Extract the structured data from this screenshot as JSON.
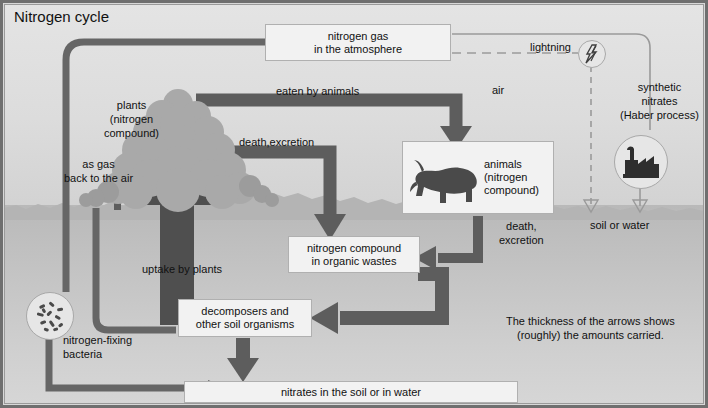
{
  "title": "Nitrogen cycle",
  "boxes": {
    "atmosphere": "nitrogen gas\nin the atmosphere",
    "animals": "animals\n(nitrogen\ncompound)",
    "organic_wastes": "nitrogen compound\nin organic wastes",
    "decomposers": "decomposers and\nother soil organisms",
    "nitrates": "nitrates in the soil or in water"
  },
  "labels": {
    "plants": "plants\n(nitrogen\ncompound)",
    "as_gas": "as gas\nback to the air",
    "eaten_by_animals": "eaten by animals",
    "death_excretion_plants": "death,excretion",
    "air": "air",
    "lightning": "lightning",
    "synthetic_nitrates": "synthetic\nnitrates\n(Haber process)",
    "soil_or_water": "soil or water",
    "death_excretion_animals": "death,\nexcretion",
    "uptake_by_plants": "uptake by plants",
    "nitrogen_fixing_bacteria": "nitrogen-fixing\nbacteria",
    "note": "The thickness of the arrows shows\n(roughly) the amounts carried."
  },
  "icons": {
    "lightning": "lightning-bolt-icon",
    "factory": "factory-icon",
    "bacteria": "bacteria-icon",
    "horse": "grazing-horse-icon",
    "plants": "shrub-tree-icon"
  },
  "colors": {
    "arrow_dark": "#5a5a5a",
    "arrow_mid": "#6e6e6e",
    "sky": "#dcdcdc",
    "ground": "#c2c2c2",
    "box_fill": "#f2f2f2",
    "frame": "#6f6f6f",
    "text": "#111111"
  },
  "legend": {
    "type": "process-cycle-diagram",
    "flows": [
      {
        "from": "nitrogen gas in the atmosphere",
        "to": "plants (nitrogen compound)",
        "label": "",
        "thickness": "thick"
      },
      {
        "from": "plants (nitrogen compound)",
        "to": "animals (nitrogen compound)",
        "label": "eaten by animals",
        "thickness": "thick"
      },
      {
        "from": "plants (nitrogen compound)",
        "to": "nitrogen compound in organic wastes",
        "label": "death,excretion",
        "thickness": "thick"
      },
      {
        "from": "animals (nitrogen compound)",
        "to": "nitrogen compound in organic wastes",
        "label": "death, excretion",
        "thickness": "medium"
      },
      {
        "from": "nitrogen compound in organic wastes",
        "to": "decomposers and other soil organisms",
        "label": "",
        "thickness": "thick"
      },
      {
        "from": "decomposers and other soil organisms",
        "to": "nitrates in the soil or in water",
        "label": "",
        "thickness": "thick"
      },
      {
        "from": "nitrates in the soil or in water",
        "to": "plants (nitrogen compound)",
        "label": "uptake by plants",
        "thickness": "very-thick"
      },
      {
        "from": "nitrogen-fixing bacteria",
        "to": "nitrates in the soil or in water",
        "label": "",
        "thickness": "medium"
      },
      {
        "from": "nitrogen gas in the atmosphere",
        "to": "nitrogen-fixing bacteria",
        "label": "as gas back to the air",
        "thickness": "medium"
      },
      {
        "from": "lightning",
        "to": "soil or water",
        "label": "",
        "thickness": "dashed"
      },
      {
        "from": "synthetic nitrates (Haber process)",
        "to": "soil or water",
        "label": "",
        "thickness": "thin"
      }
    ]
  }
}
